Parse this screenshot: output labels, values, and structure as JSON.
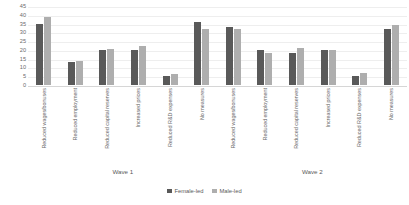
{
  "chart_data": {
    "type": "bar",
    "title": "",
    "xlabel": "",
    "ylabel": "",
    "ylim": [
      0,
      45
    ],
    "yticks": [
      0,
      5,
      10,
      15,
      20,
      25,
      30,
      35,
      40,
      45
    ],
    "grid": true,
    "legend_position": "bottom",
    "groups": [
      {
        "name": "Wave 1",
        "categories": [
          "Reduced wages/bonuses",
          "Reduced employment",
          "Reduced capital reserves",
          "Increased prices",
          "Reduced R&D expenses",
          "No measures"
        ],
        "series": [
          {
            "name": "Female-led",
            "values": [
              35,
              13,
              20,
              20,
              5,
              36
            ]
          },
          {
            "name": "Male-led",
            "values": [
              39,
              13.5,
              20.5,
              22,
              6,
              32
            ]
          }
        ]
      },
      {
        "name": "Wave 2",
        "categories": [
          "Reduced wages/bonuses",
          "Reduced employment",
          "Reduced capital reserves",
          "Increased prices",
          "Reduced R&D expenses",
          "No measures"
        ],
        "series": [
          {
            "name": "Female-led",
            "values": [
              33,
              20,
              18,
              20,
              5,
              32
            ]
          },
          {
            "name": "Male-led",
            "values": [
              32,
              18,
              21,
              20,
              7,
              34
            ]
          }
        ]
      }
    ],
    "series_colors": {
      "Female-led": "#595959",
      "Male-led": "#aeaeae"
    }
  },
  "legend": {
    "items": [
      {
        "label": "Female-led",
        "color": "#595959"
      },
      {
        "label": "Male-led",
        "color": "#aeaeae"
      }
    ]
  }
}
